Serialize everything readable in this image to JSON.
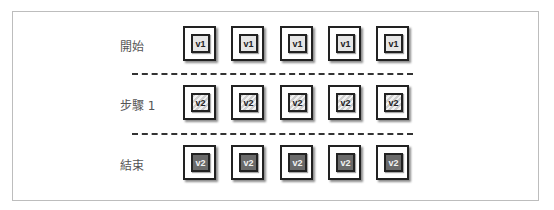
{
  "rows": [
    {
      "label": "開始",
      "version": "v1",
      "style": "light",
      "count": 5
    },
    {
      "label": "步驟 1",
      "version": "v2",
      "style": "hatched",
      "count": 5
    },
    {
      "label": "結束",
      "version": "v2",
      "style": "dark",
      "count": 5
    }
  ],
  "colors": {
    "light_fill": "#e6e6e6",
    "hatched_fill": "#cfcfcf",
    "dark_fill": "#6a6a6a",
    "border": "#222222",
    "frame": "#bdbdbd"
  }
}
